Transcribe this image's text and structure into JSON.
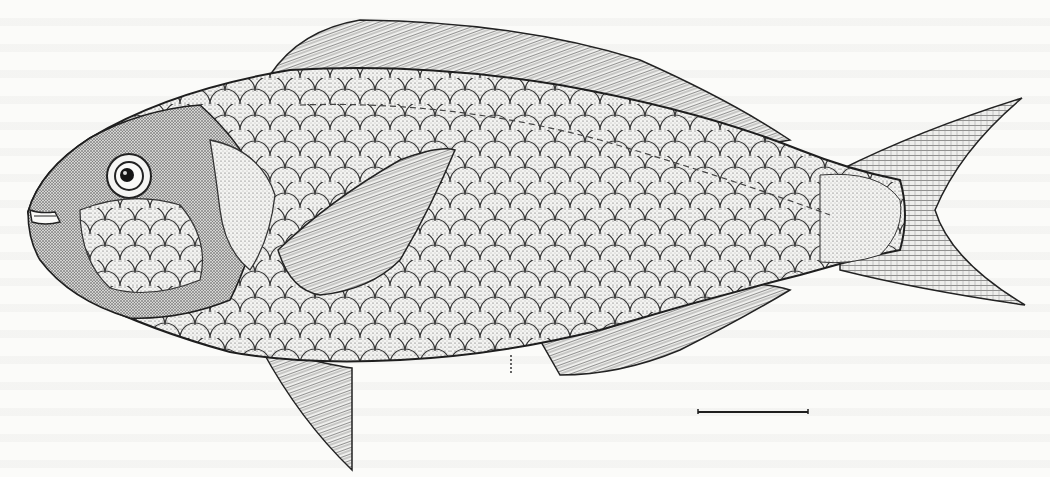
{
  "figure": {
    "style": "stipple and line pen drawing",
    "orientation": "facing left",
    "parts": [
      "head",
      "eye",
      "mouth",
      "dorsal fin",
      "pectoral fin",
      "pelvic fin",
      "anal fin",
      "caudal fin",
      "scales",
      "lateral line"
    ]
  },
  "scale_bar": {
    "x1": 698,
    "x2": 808,
    "y": 412,
    "label": ""
  },
  "colors": {
    "paper": "#fbfbf9",
    "ink": "#1e1e1e",
    "shade": "#5a5a5a"
  }
}
